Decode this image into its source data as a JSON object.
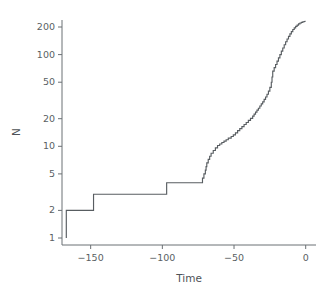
{
  "chart_data": {
    "type": "line",
    "title": "",
    "subtitle": "",
    "xlabel": "Time",
    "ylabel": "N",
    "yscale": "log",
    "xscale": "linear",
    "xlim": [
      -170,
      3
    ],
    "ylim": [
      1,
      260
    ],
    "grid": false,
    "legend": null,
    "annotations": [],
    "xticks": [
      -150,
      -100,
      -50,
      0
    ],
    "xtick_labels": [
      "−150",
      "−100",
      "−50",
      "0"
    ],
    "yticks": [
      1,
      2,
      5,
      10,
      20,
      50,
      100,
      200
    ],
    "ytick_labels": [
      "1",
      "2",
      "5",
      "10",
      "20",
      "50",
      "100",
      "200"
    ],
    "series": [
      {
        "name": "cumulative-count",
        "step": "post",
        "x": [
          -167,
          -167,
          -148,
          -148,
          -97,
          -97,
          -72,
          -72,
          -71,
          -71,
          -70,
          -70,
          -69.5,
          -69.5,
          -69,
          -69,
          -68,
          -68,
          -67,
          -67,
          -66,
          -66,
          -64.5,
          -64.5,
          -63,
          -63,
          -61.5,
          -61.5,
          -60,
          -60,
          -58.5,
          -58.5,
          -57,
          -57,
          -55.5,
          -55.5,
          -54,
          -54,
          -52,
          -52,
          -50.5,
          -50.5,
          -49,
          -49,
          -47.5,
          -47.5,
          -46,
          -46,
          -44.5,
          -44.5,
          -43,
          -43,
          -41.5,
          -41.5,
          -40,
          -40,
          -38.5,
          -38.5,
          -37,
          -37,
          -36,
          -36,
          -35,
          -35,
          -34,
          -34,
          -33,
          -33,
          -32,
          -32,
          -31,
          -31,
          -30,
          -30,
          -29,
          -29,
          -28,
          -28,
          -27,
          -27,
          -26,
          -26,
          -25,
          -25,
          -24,
          -24,
          -23.5,
          -23.5,
          -23,
          -23,
          -22,
          -22,
          -21,
          -21,
          -20,
          -20,
          -19,
          -19,
          -18,
          -18,
          -17,
          -17,
          -16,
          -16,
          -15,
          -15,
          -14,
          -14,
          -13,
          -13,
          -12,
          -12,
          -11,
          -11,
          -10,
          -10,
          -9,
          -9,
          -8,
          -8,
          -7,
          -7,
          -6,
          -6,
          -5,
          -5,
          -4,
          -4,
          -3,
          -3,
          -2,
          -2,
          -1,
          -1,
          0
        ],
        "y": [
          1,
          2,
          2,
          3,
          3,
          4,
          4,
          4.5,
          4.5,
          5,
          5,
          5.5,
          5.5,
          6,
          6,
          6.6,
          6.6,
          7.2,
          7.2,
          7.8,
          7.8,
          8.4,
          8.4,
          9,
          9,
          9.6,
          9.6,
          10.2,
          10.2,
          10.6,
          10.6,
          11,
          11,
          11.4,
          11.4,
          11.8,
          11.8,
          12.3,
          12.3,
          12.8,
          12.8,
          13.3,
          13.3,
          14,
          14,
          14.8,
          14.8,
          15.6,
          15.6,
          16.4,
          16.4,
          17.3,
          17.3,
          18.2,
          18.2,
          19.2,
          19.2,
          20.2,
          20.2,
          21.3,
          21.3,
          22.4,
          22.4,
          23.6,
          23.6,
          24.8,
          24.8,
          26,
          26,
          27.5,
          27.5,
          29,
          29,
          30.5,
          30.5,
          32.5,
          32.5,
          34.5,
          34.5,
          37,
          37,
          40,
          40,
          44,
          44,
          50,
          50,
          57,
          57,
          66,
          66,
          72,
          72,
          78,
          78,
          85,
          85,
          92,
          92,
          100,
          100,
          109,
          109,
          118,
          118,
          128,
          128,
          138,
          138,
          148,
          148,
          158,
          158,
          168,
          168,
          178,
          178,
          188,
          188,
          196,
          196,
          203,
          203,
          210,
          210,
          216,
          216,
          221,
          221,
          225,
          225,
          228,
          228,
          230,
          231
        ]
      }
    ]
  },
  "style": {
    "line_color": "#585d61",
    "axis_color": "#6b7074",
    "text_color": "#5a5f63",
    "background": "#ffffff"
  }
}
